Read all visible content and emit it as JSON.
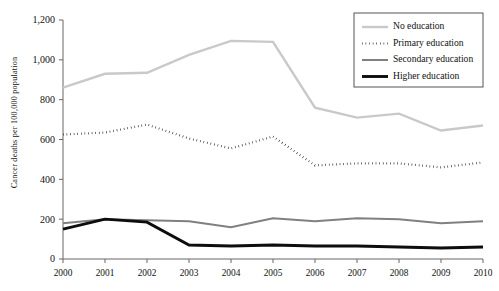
{
  "chart_data": {
    "type": "line",
    "title": "",
    "xlabel": "",
    "ylabel": "Cancer deaths per 100,000 population",
    "categories": [
      "2000",
      "2001",
      "2002",
      "2003",
      "2004",
      "2005",
      "2006",
      "2007",
      "2008",
      "2009",
      "2010"
    ],
    "x": [
      2000,
      2001,
      2002,
      2003,
      2004,
      2005,
      2006,
      2007,
      2008,
      2009,
      2010
    ],
    "ylim": [
      0,
      1200
    ],
    "yticks": [
      0,
      200,
      400,
      600,
      800,
      1000,
      1200
    ],
    "ytick_labels": [
      "0",
      "200",
      "400",
      "600",
      "800",
      "1,000",
      "1,200"
    ],
    "grid": false,
    "legend_position": "top-right",
    "series": [
      {
        "name": "No education",
        "values": [
          860,
          930,
          935,
          1025,
          1095,
          1090,
          760,
          710,
          730,
          645,
          670
        ],
        "color": "#c9c9c9",
        "style": "solid",
        "width": 2.4
      },
      {
        "name": "Primary education",
        "values": [
          625,
          635,
          675,
          605,
          555,
          615,
          470,
          480,
          480,
          460,
          485
        ],
        "color": "#1a1a1a",
        "style": "dotted",
        "width": 2.2
      },
      {
        "name": "Secondary education",
        "values": [
          180,
          200,
          195,
          190,
          160,
          205,
          190,
          205,
          200,
          180,
          190
        ],
        "color": "#808080",
        "style": "solid",
        "width": 2.0
      },
      {
        "name": "Higher education",
        "values": [
          150,
          200,
          185,
          70,
          65,
          70,
          65,
          65,
          60,
          55,
          60
        ],
        "color": "#0d0d0d",
        "style": "solid",
        "width": 2.9
      }
    ]
  },
  "legend": {
    "items": [
      {
        "label": "No education"
      },
      {
        "label": "Primary education"
      },
      {
        "label": "Secondary education"
      },
      {
        "label": "Higher education"
      }
    ]
  }
}
